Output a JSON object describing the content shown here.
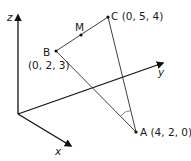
{
  "diagram": {
    "type": "3d-coordinate-geometry",
    "axes": {
      "x": {
        "label": "x"
      },
      "y": {
        "label": "y"
      },
      "z": {
        "label": "z"
      }
    },
    "points": {
      "A": {
        "name": "A",
        "coords": "(4, 2, 0)",
        "label": "A (4, 2, 0)"
      },
      "B": {
        "name": "B",
        "coords": "(0, 2, 3)"
      },
      "C": {
        "name": "C",
        "coords": "(0, 5, 4)",
        "label": "C (0, 5, 4)"
      },
      "M": {
        "name": "M",
        "description": "midpoint of BC"
      }
    },
    "segments": [
      "BC",
      "AB",
      "AC"
    ],
    "marked_angle": "BAC",
    "colors": {
      "line": "#2a2a2a",
      "axis": "#111111",
      "text": "#1a1a1a",
      "background": "#ffffff"
    }
  }
}
